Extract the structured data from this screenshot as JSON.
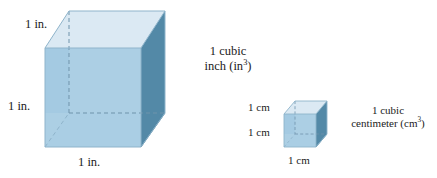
{
  "figure": {
    "background_color": "#ffffff",
    "text_color": "#1b1b1b"
  },
  "palette": {
    "top_face": "#dbe9f3",
    "front_face": "#a9cde3",
    "right_face": "#5389a7",
    "bottom_face": "#c6dcec",
    "edge_dark": "#7fa8c0",
    "hidden_edge": "#6f93ab",
    "outline": "#8fb4cb"
  },
  "cubes": [
    {
      "id": "inch-cube",
      "labels": {
        "depth": "1 in.",
        "height": "1 in.",
        "width": "1 in."
      },
      "caption": {
        "line1": "1 cubic",
        "line2_prefix": "inch (in",
        "line2_exponent": "3",
        "line2_suffix": ")"
      }
    },
    {
      "id": "centimeter-cube",
      "labels": {
        "depth": "1 cm",
        "height": "1 cm",
        "width": "1 cm"
      },
      "caption": {
        "line1": "1 cubic",
        "line2_prefix": "centimeter (cm",
        "line2_exponent": "3",
        "line2_suffix": ")"
      }
    }
  ]
}
